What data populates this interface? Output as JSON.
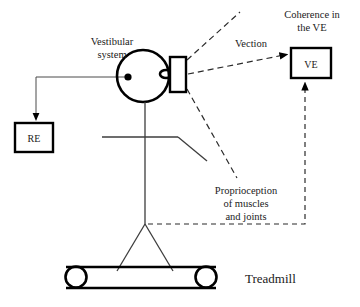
{
  "figure": {
    "background_color": "#ffffff",
    "line_color": "#000000",
    "text_color": "#1a1a1a"
  },
  "labels": {
    "vestibular_system_line1": "Vestibular",
    "vestibular_system_line2": "system",
    "coherence_line1": "Coherence in",
    "coherence_line2": "the VE",
    "vection": "Vection",
    "proprioception_line1": "Proprioception",
    "proprioception_line2": "of muscles",
    "proprioception_line3": "and joints",
    "treadmill": "Treadmill"
  },
  "boxes": [
    {
      "id": "re-box",
      "label": "RE",
      "x": 15,
      "y": 123,
      "width": 38,
      "height": 29
    },
    {
      "id": "ve-box",
      "label": "VE",
      "x": 291,
      "y": 48,
      "width": 40,
      "height": 30
    }
  ],
  "nodes": {
    "head": {
      "name": "head-circle",
      "cx": 143,
      "cy": 76,
      "r": 26
    },
    "vestibular_organ": {
      "name": "vestibular-dot",
      "cx": 128,
      "cy": 77,
      "r": 3.6
    },
    "eye": {
      "name": "eye-ellipse",
      "cx": 166,
      "cy": 74,
      "rx": 6,
      "ry": 4
    },
    "hmd": {
      "name": "head-mounted-display",
      "x": 170,
      "y": 57,
      "width": 16,
      "height": 35
    }
  },
  "treadmill": {
    "belt_left": 66,
    "belt_right": 216,
    "belt_top": 267,
    "belt_bottom": 288,
    "roller_radius": 10
  },
  "connections": [
    {
      "id": "vestibular-to-re",
      "style": "solid",
      "from": "vestibular-dot",
      "to": "re-box",
      "arrow": "down"
    },
    {
      "id": "vection-to-ve",
      "style": "dashed",
      "from": "head-mounted-display",
      "to": "ve-box",
      "label": "Vection",
      "arrow": "right"
    },
    {
      "id": "proprioception-to-ve",
      "style": "dashed",
      "from": "hip",
      "to": "ve-box",
      "label": "Proprioception of muscles and joints",
      "arrow": "up"
    },
    {
      "id": "field-of-view-upper",
      "style": "dashed",
      "from": "head-mounted-display",
      "to": "upper-right",
      "arrow": "none"
    },
    {
      "id": "field-of-view-lower",
      "style": "dashed",
      "from": "head-mounted-display",
      "to": "lower-right",
      "arrow": "none"
    }
  ]
}
